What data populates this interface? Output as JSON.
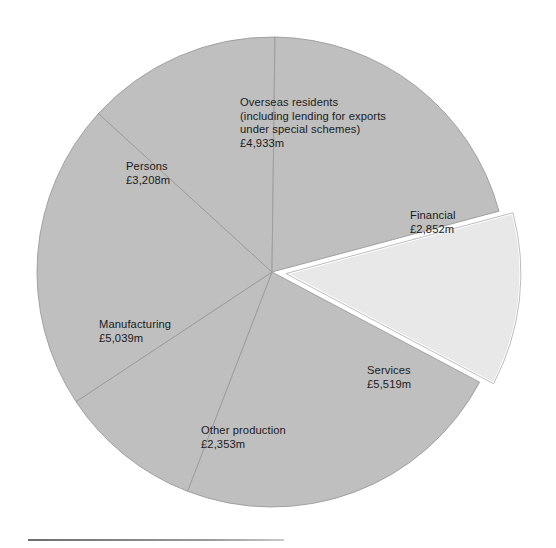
{
  "figure": {
    "background_color": "#ffffff",
    "slice_fill": "#bfbfbf",
    "exploded_fill": "#e8e8e8",
    "divider_color": "#9b9b9b",
    "explode_outline_color": "#ffffff",
    "text_color": "#1b1b1b",
    "currency_symbol": "£",
    "unit_suffix": "m"
  },
  "chart_data": {
    "type": "pie",
    "title": "",
    "subtitle": "",
    "xlabel": "",
    "ylabel": "",
    "legend_position": "none",
    "grid": false,
    "units": "£ million",
    "total": 23904,
    "total_label": "£23,904m",
    "center": {
      "x": 272,
      "y": 272
    },
    "radius": 235,
    "explode_offset": 14,
    "start_angle_deg": -15,
    "categories": [
      "Financial",
      "Services",
      "Other production",
      "Manufacturing",
      "Persons",
      "Overseas residents (including lending for exports under special schemes)"
    ],
    "values": [
      2852,
      5519,
      2353,
      5039,
      3208,
      4933
    ],
    "slices": [
      {
        "id": "financial",
        "name": "Financial",
        "name_lines": [
          "Financial"
        ],
        "value": 2852,
        "value_label": "£2,852m",
        "percent": 11.9,
        "exploded": true,
        "fill": "#e8e8e8",
        "start_angle_deg": -15.0,
        "end_angle_deg": 27.95,
        "label_x": 410,
        "label_y": 209
      },
      {
        "id": "services",
        "name": "Services",
        "name_lines": [
          "Services"
        ],
        "value": 5519,
        "value_label": "£5,519m",
        "percent": 23.1,
        "exploded": false,
        "fill": "#bfbfbf",
        "start_angle_deg": 27.95,
        "end_angle_deg": 111.07,
        "label_x": 367,
        "label_y": 364
      },
      {
        "id": "other-production",
        "name": "Other production",
        "name_lines": [
          "Other production"
        ],
        "value": 2353,
        "value_label": "£2,353m",
        "percent": 9.8,
        "exploded": false,
        "fill": "#bfbfbf",
        "start_angle_deg": 111.07,
        "end_angle_deg": 146.51,
        "label_x": 201,
        "label_y": 424
      },
      {
        "id": "manufacturing",
        "name": "Manufacturing",
        "name_lines": [
          "Manufacturing"
        ],
        "value": 5039,
        "value_label": "£5,039m",
        "percent": 21.1,
        "exploded": false,
        "fill": "#bfbfbf",
        "start_angle_deg": 146.51,
        "end_angle_deg": 222.4,
        "label_x": 99,
        "label_y": 318
      },
      {
        "id": "persons",
        "name": "Persons",
        "name_lines": [
          "Persons"
        ],
        "value": 3208,
        "value_label": "£3,208m",
        "percent": 13.4,
        "exploded": false,
        "fill": "#bfbfbf",
        "start_angle_deg": 222.4,
        "end_angle_deg": 270.73,
        "label_x": 126,
        "label_y": 160
      },
      {
        "id": "overseas-residents",
        "name": "Overseas residents (including lending for exports under special schemes)",
        "name_lines": [
          "Overseas residents",
          "(including lending for exports",
          "under special schemes)"
        ],
        "value": 4933,
        "value_label": "£4,933m",
        "percent": 20.6,
        "exploded": false,
        "fill": "#bfbfbf",
        "start_angle_deg": 270.73,
        "end_angle_deg": 345.0,
        "label_x": 240,
        "label_y": 96
      }
    ]
  }
}
